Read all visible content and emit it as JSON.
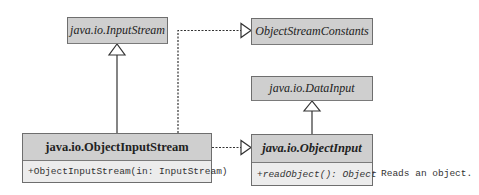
{
  "diagram": {
    "type": "uml-class-diagram",
    "classes": [
      {
        "id": "input_stream",
        "name": "java.io.InputStream",
        "abstract": true
      },
      {
        "id": "object_stream_constants",
        "name": "ObjectStreamConstants",
        "interface": true
      },
      {
        "id": "data_input",
        "name": "java.io.DataInput",
        "interface": true
      },
      {
        "id": "object_input_stream",
        "name": "java.io.ObjectInputStream",
        "methods": [
          "+ObjectInputStream(in: InputStream)"
        ]
      },
      {
        "id": "object_input",
        "name": "java.io.ObjectInput",
        "interface": true,
        "methods": [
          "+readObject(): Object"
        ]
      }
    ],
    "relations": [
      {
        "from": "object_input_stream",
        "to": "input_stream",
        "kind": "extends"
      },
      {
        "from": "object_input_stream",
        "to": "object_stream_constants",
        "kind": "implements"
      },
      {
        "from": "object_input_stream",
        "to": "object_input",
        "kind": "implements"
      },
      {
        "from": "object_input",
        "to": "data_input",
        "kind": "extends"
      }
    ],
    "notes": [
      {
        "attached_to": "object_input.readObject",
        "text": "Reads an object."
      }
    ]
  },
  "labels": {
    "input_stream": "java.io.InputStream",
    "object_stream_constants": "ObjectStreamConstants",
    "data_input": "java.io.DataInput",
    "object_input_stream": "java.io.ObjectInputStream",
    "object_input_stream_ctor": "+ObjectInputStream(in: InputStream)",
    "object_input": "java.io.ObjectInput",
    "read_object": "+readObject(): Object",
    "read_object_note": "Reads an object."
  }
}
